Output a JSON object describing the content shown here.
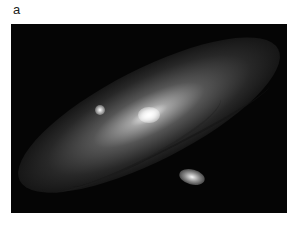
{
  "figure": {
    "panel_label": "a",
    "image": {
      "subject": "spiral galaxy with two satellite galaxies on star field",
      "background_color": "#050505"
    }
  }
}
